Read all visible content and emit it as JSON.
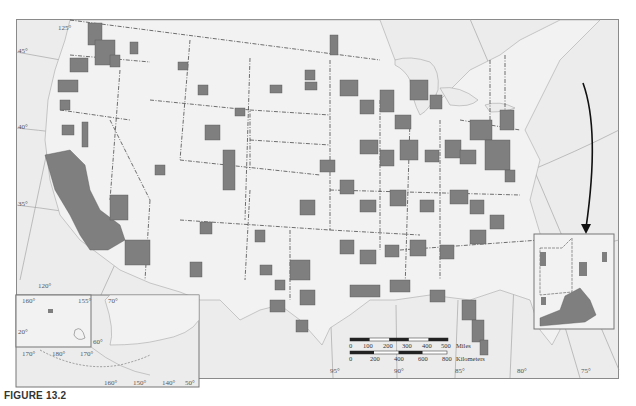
{
  "figure": {
    "caption": "FIGURE 13.2"
  },
  "map": {
    "colors": {
      "background": "#ececec",
      "land": "#f2f2f2",
      "shaded_county": "#7f7f7f",
      "state_border": "#333333",
      "graticule": "#9a9a9a",
      "water_line": "#a8a8a8",
      "frame": "#8a8a8a"
    },
    "latitude_labels": [
      "45°",
      "40°",
      "35°"
    ],
    "longitude_labels_top": [
      "125°"
    ],
    "longitude_labels_bottom": [
      "120°",
      "95°",
      "90°",
      "85°",
      "80°",
      "75°"
    ],
    "scale_bar": {
      "miles_ticks": [
        "0",
        "100",
        "200",
        "300",
        "400",
        "500"
      ],
      "miles_unit": "Miles",
      "km_ticks": [
        "0",
        "200",
        "400",
        "600",
        "800"
      ],
      "km_unit": "Kilometers"
    },
    "inset_alaska_hawaii": {
      "hawaii_labels": [
        "160°",
        "155°",
        "20°"
      ],
      "alaska_labels": [
        "70°",
        "60°",
        "170°",
        "180°",
        "170°",
        "160°",
        "150°",
        "140°",
        "50°"
      ]
    },
    "inset_new_england": {
      "arrow": "pointer-arrow"
    }
  }
}
